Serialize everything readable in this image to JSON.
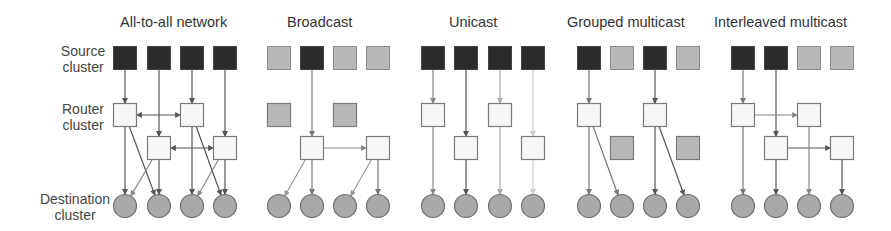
{
  "row_labels": {
    "source": [
      "Source",
      "cluster"
    ],
    "router": [
      "Router",
      "cluster"
    ],
    "destination": [
      "Destination",
      "cluster"
    ]
  },
  "colors": {
    "active_source": "#2b2b2b",
    "inactive": "#b8b8b8",
    "router": "#f7f7f7",
    "destination": "#a9a9a9",
    "border": "#7a7a7a",
    "edge": "#6a6a6a"
  },
  "panels": [
    {
      "title": "All-to-all network",
      "title_x": 120,
      "cols": [
        125,
        159,
        192,
        225
      ],
      "sources": [
        "active",
        "active",
        "active",
        "active"
      ],
      "routers": [
        {
          "col": 0,
          "row": 1,
          "state": "router"
        },
        {
          "col": 2,
          "row": 1,
          "state": "router"
        },
        {
          "col": 1,
          "row": 2,
          "state": "router"
        },
        {
          "col": 3,
          "row": 2,
          "state": "router"
        }
      ],
      "edges": [
        {
          "from": [
            "s",
            0
          ],
          "to": [
            "r",
            0
          ],
          "shade": "#555"
        },
        {
          "from": [
            "s",
            1
          ],
          "to": [
            "r",
            2
          ],
          "shade": "#555"
        },
        {
          "from": [
            "s",
            2
          ],
          "to": [
            "r",
            1
          ],
          "shade": "#555"
        },
        {
          "from": [
            "s",
            3
          ],
          "to": [
            "r",
            3
          ],
          "shade": "#555"
        },
        {
          "from": [
            "r",
            0
          ],
          "to": [
            "r",
            1
          ],
          "shade": "#555",
          "bidir": true
        },
        {
          "from": [
            "r",
            2
          ],
          "to": [
            "r",
            3
          ],
          "shade": "#555",
          "bidir": true
        },
        {
          "from": [
            "r",
            0
          ],
          "to": [
            "d",
            0
          ],
          "shade": "#555"
        },
        {
          "from": [
            "r",
            0
          ],
          "to": [
            "d",
            1
          ],
          "shade": "#555"
        },
        {
          "from": [
            "r",
            2
          ],
          "to": [
            "d",
            0
          ],
          "shade": "#888"
        },
        {
          "from": [
            "r",
            2
          ],
          "to": [
            "d",
            1
          ],
          "shade": "#555"
        },
        {
          "from": [
            "r",
            1
          ],
          "to": [
            "d",
            2
          ],
          "shade": "#555"
        },
        {
          "from": [
            "r",
            1
          ],
          "to": [
            "d",
            3
          ],
          "shade": "#555"
        },
        {
          "from": [
            "r",
            3
          ],
          "to": [
            "d",
            2
          ],
          "shade": "#888"
        },
        {
          "from": [
            "r",
            3
          ],
          "to": [
            "d",
            3
          ],
          "shade": "#555"
        }
      ]
    },
    {
      "title": "Broadcast",
      "title_x": 287,
      "cols": [
        279,
        312,
        345,
        378
      ],
      "sources": [
        "inactive",
        "active",
        "inactive",
        "inactive"
      ],
      "routers": [
        {
          "col": 0,
          "row": 1,
          "state": "inactive"
        },
        {
          "col": 2,
          "row": 1,
          "state": "inactive"
        },
        {
          "col": 1,
          "row": 2,
          "state": "router"
        },
        {
          "col": 3,
          "row": 2,
          "state": "router"
        }
      ],
      "edges": [
        {
          "from": [
            "s",
            1
          ],
          "to": [
            "r",
            2
          ],
          "shade": "#777"
        },
        {
          "from": [
            "r",
            2
          ],
          "to": [
            "r",
            3
          ],
          "shade": "#888"
        },
        {
          "from": [
            "r",
            2
          ],
          "to": [
            "d",
            0
          ],
          "shade": "#999"
        },
        {
          "from": [
            "r",
            2
          ],
          "to": [
            "d",
            1
          ],
          "shade": "#777"
        },
        {
          "from": [
            "r",
            3
          ],
          "to": [
            "d",
            2
          ],
          "shade": "#999"
        },
        {
          "from": [
            "r",
            3
          ],
          "to": [
            "d",
            3
          ],
          "shade": "#777"
        }
      ]
    },
    {
      "title": "Unicast",
      "title_x": 449,
      "cols": [
        433,
        466,
        500,
        533
      ],
      "sources": [
        "active",
        "active",
        "active",
        "active"
      ],
      "routers": [
        {
          "col": 0,
          "row": 1,
          "state": "router"
        },
        {
          "col": 2,
          "row": 1,
          "state": "router"
        },
        {
          "col": 1,
          "row": 2,
          "state": "router"
        },
        {
          "col": 3,
          "row": 2,
          "state": "router"
        }
      ],
      "edges": [
        {
          "from": [
            "s",
            0
          ],
          "to": [
            "r",
            0
          ],
          "shade": "#888"
        },
        {
          "from": [
            "s",
            1
          ],
          "to": [
            "r",
            2
          ],
          "shade": "#555"
        },
        {
          "from": [
            "s",
            2
          ],
          "to": [
            "r",
            1
          ],
          "shade": "#aaa"
        },
        {
          "from": [
            "s",
            3
          ],
          "to": [
            "r",
            3
          ],
          "shade": "#ccc"
        },
        {
          "from": [
            "r",
            0
          ],
          "to": [
            "d",
            0
          ],
          "shade": "#888"
        },
        {
          "from": [
            "r",
            2
          ],
          "to": [
            "d",
            1
          ],
          "shade": "#555"
        },
        {
          "from": [
            "r",
            1
          ],
          "to": [
            "d",
            2
          ],
          "shade": "#aaa"
        },
        {
          "from": [
            "r",
            3
          ],
          "to": [
            "d",
            3
          ],
          "shade": "#ccc"
        }
      ]
    },
    {
      "title": "Grouped multicast",
      "title_x": 567,
      "cols": [
        589,
        622,
        655,
        688
      ],
      "sources": [
        "active",
        "inactive",
        "active",
        "inactive"
      ],
      "routers": [
        {
          "col": 0,
          "row": 1,
          "state": "router"
        },
        {
          "col": 2,
          "row": 1,
          "state": "router"
        },
        {
          "col": 1,
          "row": 2,
          "state": "inactive"
        },
        {
          "col": 3,
          "row": 2,
          "state": "inactive"
        }
      ],
      "edges": [
        {
          "from": [
            "s",
            0
          ],
          "to": [
            "r",
            0
          ],
          "shade": "#777"
        },
        {
          "from": [
            "s",
            2
          ],
          "to": [
            "r",
            1
          ],
          "shade": "#555"
        },
        {
          "from": [
            "r",
            0
          ],
          "to": [
            "d",
            0
          ],
          "shade": "#777"
        },
        {
          "from": [
            "r",
            0
          ],
          "to": [
            "d",
            1
          ],
          "shade": "#777"
        },
        {
          "from": [
            "r",
            1
          ],
          "to": [
            "d",
            2
          ],
          "shade": "#555"
        },
        {
          "from": [
            "r",
            1
          ],
          "to": [
            "d",
            3
          ],
          "shade": "#555"
        }
      ]
    },
    {
      "title": "Interleaved multicast",
      "title_x": 714,
      "cols": [
        743,
        776,
        809,
        842
      ],
      "sources": [
        "active",
        "active",
        "inactive",
        "inactive"
      ],
      "routers": [
        {
          "col": 0,
          "row": 1,
          "state": "router"
        },
        {
          "col": 2,
          "row": 1,
          "state": "router"
        },
        {
          "col": 1,
          "row": 2,
          "state": "router"
        },
        {
          "col": 3,
          "row": 2,
          "state": "router"
        }
      ],
      "edges": [
        {
          "from": [
            "s",
            0
          ],
          "to": [
            "r",
            0
          ],
          "shade": "#777"
        },
        {
          "from": [
            "s",
            1
          ],
          "to": [
            "r",
            2
          ],
          "shade": "#555"
        },
        {
          "from": [
            "r",
            0
          ],
          "to": [
            "r",
            1
          ],
          "shade": "#888"
        },
        {
          "from": [
            "r",
            2
          ],
          "to": [
            "r",
            3
          ],
          "shade": "#555"
        },
        {
          "from": [
            "r",
            0
          ],
          "to": [
            "d",
            0
          ],
          "shade": "#777"
        },
        {
          "from": [
            "r",
            2
          ],
          "to": [
            "d",
            1
          ],
          "shade": "#555"
        },
        {
          "from": [
            "r",
            1
          ],
          "to": [
            "d",
            2
          ],
          "shade": "#888"
        },
        {
          "from": [
            "r",
            3
          ],
          "to": [
            "d",
            3
          ],
          "shade": "#555"
        }
      ]
    }
  ]
}
